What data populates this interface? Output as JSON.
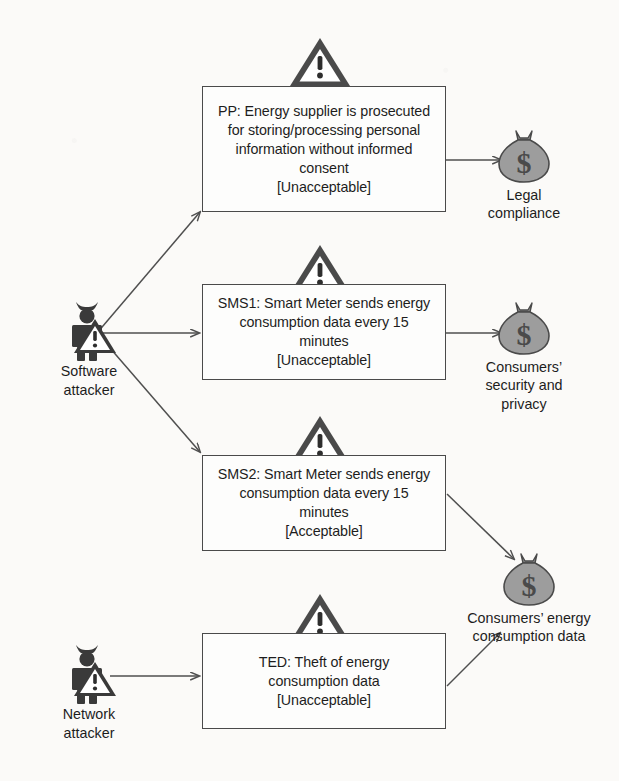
{
  "diagram": {
    "colors": {
      "background": "#fbfaf8",
      "box_border": "#4a4a4a",
      "box_fill": "#fdfdfc",
      "text": "#1d1d1d",
      "edge": "#4f4f4f",
      "attacker_fill": "#3a3a3a",
      "asset_fill": "#9d9d9d",
      "asset_stroke": "#4a4a4a",
      "warning_fill": "#4a4a4a",
      "warning_inner": "#ffffff"
    },
    "actors": [
      {
        "id": "software-attacker",
        "icon": "attacker-figure-icon",
        "label_lines": [
          "Software",
          "attacker"
        ]
      },
      {
        "id": "network-attacker",
        "icon": "attacker-figure-icon",
        "label_lines": [
          "Network",
          "attacker"
        ]
      }
    ],
    "threats": [
      {
        "id": "pp",
        "icon": "warning-triangle-icon",
        "lines": [
          "PP: Energy supplier is prosecuted",
          "for storing/processing personal",
          "information without informed",
          "consent"
        ],
        "verdict": "[Unacceptable]"
      },
      {
        "id": "sms1",
        "icon": "warning-triangle-icon",
        "lines": [
          "SMS1: Smart Meter sends energy",
          "consumption data every 15",
          "minutes"
        ],
        "verdict": "[Unacceptable]"
      },
      {
        "id": "sms2",
        "icon": "warning-triangle-icon",
        "lines": [
          "SMS2: Smart Meter sends energy",
          "consumption data every 15",
          "minutes"
        ],
        "verdict": "[Acceptable]"
      },
      {
        "id": "ted",
        "icon": "warning-triangle-icon",
        "lines": [
          "TED: Theft of energy",
          "consumption data"
        ],
        "verdict": "[Unacceptable]"
      }
    ],
    "assets": [
      {
        "id": "legal-compliance",
        "icon": "money-bag-icon",
        "symbol": "$",
        "label_lines": [
          "Legal",
          "compliance"
        ]
      },
      {
        "id": "consumers-security-privacy",
        "icon": "money-bag-icon",
        "symbol": "$",
        "label_lines": [
          "Consumers’",
          "security and",
          "privacy"
        ]
      },
      {
        "id": "consumers-energy-consumption-data",
        "icon": "money-bag-icon",
        "symbol": "$",
        "label_lines": [
          "Consumers’ energy",
          "consumption data"
        ]
      }
    ],
    "edges": [
      {
        "id": "software-attacker-to-pp",
        "from": "software-attacker",
        "to": "pp"
      },
      {
        "id": "software-attacker-to-sms1",
        "from": "software-attacker",
        "to": "sms1"
      },
      {
        "id": "software-attacker-to-sms2",
        "from": "software-attacker",
        "to": "sms2"
      },
      {
        "id": "network-attacker-to-ted",
        "from": "network-attacker",
        "to": "ted"
      },
      {
        "id": "pp-to-legal-compliance",
        "from": "pp",
        "to": "legal-compliance"
      },
      {
        "id": "sms1-to-consumers-security-privacy",
        "from": "sms1",
        "to": "consumers-security-privacy"
      },
      {
        "id": "sms2-to-consumers-energy-consumption-data",
        "from": "sms2",
        "to": "consumers-energy-consumption-data"
      },
      {
        "id": "ted-to-consumers-energy-consumption-data",
        "from": "ted",
        "to": "consumers-energy-consumption-data"
      }
    ]
  }
}
